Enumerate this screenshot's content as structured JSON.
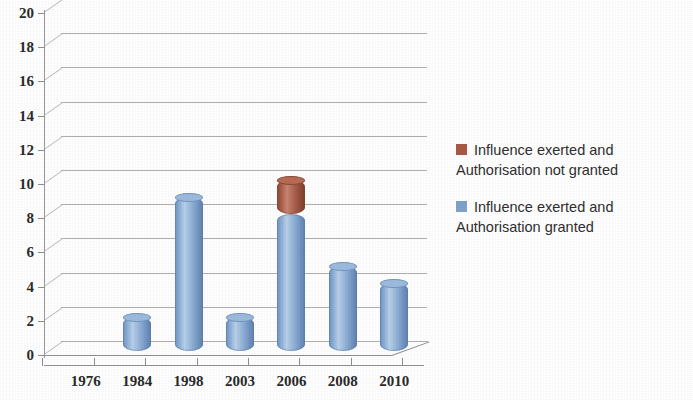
{
  "chart_data": {
    "type": "bar",
    "title": "",
    "subtitle": "",
    "xlabel": "",
    "ylabel": "",
    "categories": [
      "1976",
      "1984",
      "1998",
      "2003",
      "2006",
      "2008",
      "2010"
    ],
    "series": [
      {
        "name": "Influence exerted and Authorisation granted",
        "color": "#7ea3cc",
        "values": [
          0,
          2,
          9,
          2,
          8,
          5,
          4
        ]
      },
      {
        "name": "Influence exerted and Authorisation not granted",
        "color": "#a85a45",
        "values": [
          0,
          0,
          0,
          0,
          2,
          0,
          0
        ]
      }
    ],
    "stacked": true,
    "totals": [
      0,
      2,
      9,
      2,
      10,
      5,
      4
    ],
    "ylim": [
      0,
      20
    ],
    "ytick_step": 2,
    "ytick_labels": [
      "0",
      "2",
      "4",
      "6",
      "8",
      "10",
      "12",
      "14",
      "16",
      "18",
      "20"
    ],
    "grid": true,
    "grid_axis": "y",
    "legend_position": "right",
    "style": "3d-cylinder"
  },
  "axes": {
    "y_labels": [
      "20",
      "18",
      "16",
      "14",
      "12",
      "10",
      "8",
      "6",
      "4",
      "2",
      "0"
    ],
    "x_labels": [
      "1976",
      "1984",
      "1998",
      "2003",
      "2006",
      "2008",
      "2010"
    ]
  },
  "legend": {
    "items": [
      {
        "swatch_color": "#a85a45",
        "line1": "Influence exerted and",
        "line2": "Authorisation not granted"
      },
      {
        "swatch_color": "#7ea3cc",
        "line1": "Influence exerted and",
        "line2": "Authorisation granted"
      }
    ]
  }
}
